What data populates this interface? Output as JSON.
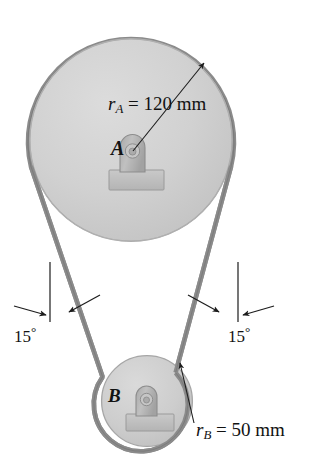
{
  "figure": {
    "background_color": "#ffffff",
    "width": 314,
    "height": 465
  },
  "labels": {
    "pulley_a_name": "A",
    "pulley_b_name": "B",
    "radius_a_var": "r",
    "radius_a_sub": "A",
    "radius_a_eq": " = 120 mm",
    "radius_a_full": "r_A = 120 mm",
    "radius_b_var": "r",
    "radius_b_sub": "B",
    "radius_b_eq": " = 50 mm",
    "radius_b_full": "r_B = 50 mm",
    "angle_left_value": "15",
    "angle_left_unit": "°",
    "angle_right_value": "15",
    "angle_right_unit": "°"
  },
  "geometry": {
    "pulley_a": {
      "cx": 131,
      "cy": 140,
      "r": 101,
      "radius_mm": 120,
      "label": "A"
    },
    "pulley_b": {
      "cx": 147,
      "cy": 401,
      "r": 45,
      "radius_mm": 50,
      "label": "B"
    },
    "belt_angle_deg": 15,
    "belt_thickness_px": 4
  },
  "colors": {
    "pulley_fill": "#cbcbcb",
    "pulley_fill_light": "#d6d6d6",
    "pulley_edge": "#9a9a9a",
    "belt": "#8d8d8d",
    "belt_dark": "#7a7a7a",
    "hub_fill": "#b2b2b2",
    "hub_edge": "#8a8a8a",
    "base_fill": "#bdbdbd",
    "base_edge": "#949494",
    "pin_fill": "#c4c4c4",
    "leader_line": "#1c1c1c",
    "text": "#121212",
    "background": "#ffffff"
  },
  "annotations": {
    "radius_a_leader": "arrow from label to pulley A rim (upper right)",
    "radius_b_leader": "arrow from label to pulley B rim (upper right)",
    "angle_left_marks": "vertical reference line with two inward arrows",
    "angle_right_marks": "vertical reference line with two inward arrows"
  }
}
